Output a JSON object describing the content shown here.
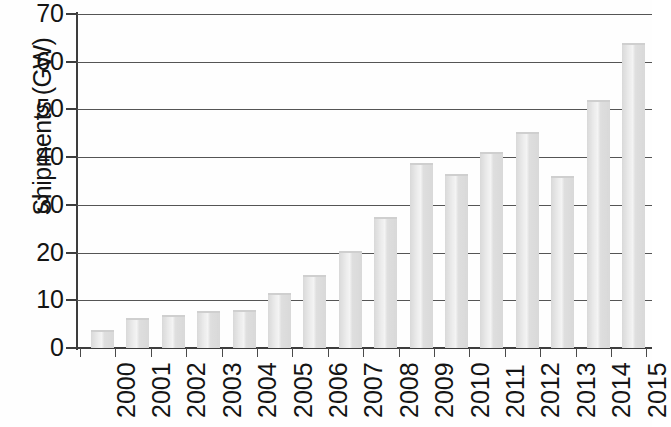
{
  "chart_data": {
    "type": "bar",
    "title": "",
    "subtitle": "",
    "xlabel": "",
    "ylabel": "Shipments (GW)",
    "categories": [
      "2000",
      "2001",
      "2002",
      "2003",
      "2004",
      "2005",
      "2006",
      "2007",
      "2008",
      "2009",
      "2010",
      "2011",
      "2012",
      "2013",
      "2014",
      "2015"
    ],
    "values": [
      3.7,
      6.2,
      7.0,
      7.8,
      8.0,
      11.5,
      15.2,
      20.3,
      27.5,
      38.7,
      36.5,
      41.0,
      45.2,
      36.0,
      52.0,
      64.0
    ],
    "series": [
      {
        "name": "Shipments",
        "values": [
          3.7,
          6.2,
          7.0,
          7.8,
          8.0,
          11.5,
          15.2,
          20.3,
          27.5,
          38.7,
          36.5,
          41.0,
          45.2,
          36.0,
          52.0,
          64.0
        ]
      }
    ],
    "ylim": [
      0,
      70
    ],
    "ytick_labels": [
      "0",
      "10",
      "20",
      "30",
      "40",
      "50",
      "60",
      "70"
    ],
    "ytick_values": [
      0,
      10,
      20,
      30,
      40,
      50,
      60,
      70
    ],
    "grid": "horizontal",
    "legend": "none",
    "bar_color": "#d9d9d9",
    "axis_color": "#3d3d3d",
    "gridline_color": "#555555",
    "text_color": "#141414",
    "annotations": []
  }
}
